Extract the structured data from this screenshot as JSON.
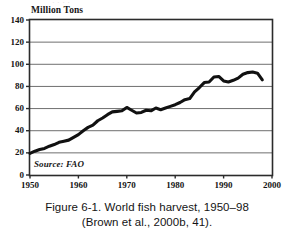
{
  "figure": {
    "scan_bleed_top_text": "·   ·    ·  ·",
    "caption_line_1": "Figure 6-1. World fish harvest, 1950–98",
    "caption_line_2": "(Brown et al., 2000b, 41).",
    "source_note": "Source: FAO",
    "axis_unit_label": "Million Tons"
  },
  "colors": {
    "line": "#111111",
    "grid": "#6f6f6f",
    "frame": "#2b2b2b",
    "text": "#141414",
    "background": "#ffffff"
  },
  "chart_data": {
    "type": "line",
    "title": "World fish harvest, 1950–98",
    "subtitle": "",
    "xlabel": "",
    "ylabel": "Million Tons",
    "xlim": [
      1950,
      2000
    ],
    "ylim": [
      0,
      140
    ],
    "xticks": [
      1950,
      1960,
      1970,
      1980,
      1990,
      2000
    ],
    "yticks": [
      0,
      20,
      40,
      60,
      80,
      100,
      120,
      140
    ],
    "xtick_labels": [
      "1950",
      "1960",
      "1970",
      "1980",
      "1990",
      "2000"
    ],
    "ytick_labels": [
      "0",
      "20",
      "40",
      "60",
      "80",
      "100",
      "120",
      "140"
    ],
    "grid": "horizontal",
    "legend": "none",
    "annotations": [
      "Source: FAO"
    ],
    "series": [
      {
        "name": "World fish harvest",
        "unit": "million tons",
        "x": [
          1950,
          1951,
          1952,
          1953,
          1954,
          1955,
          1956,
          1957,
          1958,
          1959,
          1960,
          1961,
          1962,
          1963,
          1964,
          1965,
          1966,
          1967,
          1968,
          1969,
          1970,
          1971,
          1972,
          1973,
          1974,
          1975,
          1976,
          1977,
          1978,
          1979,
          1980,
          1981,
          1982,
          1983,
          1984,
          1985,
          1986,
          1987,
          1988,
          1989,
          1990,
          1991,
          1992,
          1993,
          1994,
          1995,
          1996,
          1997,
          1998
        ],
        "values": [
          19.6,
          21.5,
          23.0,
          24.0,
          26.0,
          27.5,
          29.5,
          30.5,
          31.5,
          34.0,
          36.5,
          40.0,
          43.0,
          45.0,
          49.0,
          51.5,
          54.5,
          57.0,
          57.5,
          58.0,
          61.0,
          58.5,
          56.0,
          56.5,
          58.5,
          58.0,
          60.5,
          59.0,
          60.5,
          62.0,
          63.5,
          65.5,
          68.0,
          69.0,
          75.0,
          79.0,
          83.5,
          84.0,
          88.5,
          89.0,
          85.0,
          84.0,
          85.5,
          87.5,
          91.0,
          92.5,
          93.0,
          92.0,
          86.0
        ]
      }
    ]
  }
}
